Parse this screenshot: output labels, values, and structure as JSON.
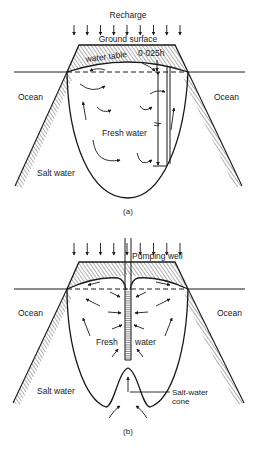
{
  "figure": {
    "panel_a": {
      "caption": "(a)",
      "labels": {
        "recharge": "Recharge",
        "ground_surface": "Ground surface",
        "water_table": "water table",
        "water_table_height": "0·025h",
        "depth_symbol": "h",
        "ocean_left": "Ocean",
        "ocean_right": "Ocean",
        "fresh_water": "Fresh water",
        "salt_water": "Salt water"
      },
      "recharge_arrow_count": 9
    },
    "panel_b": {
      "caption": "(b)",
      "labels": {
        "pumping_well": "Pumping well",
        "ocean_left": "Ocean",
        "ocean_right": "Ocean",
        "fresh": "Fresh",
        "water": "water",
        "salt_water": "Salt water",
        "salt_water_cone_line1": "Salt-water",
        "salt_water_cone_line2": "cone"
      },
      "recharge_arrow_count": 9
    }
  }
}
